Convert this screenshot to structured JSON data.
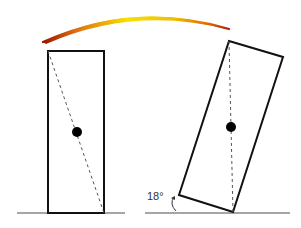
{
  "diagram": {
    "title": "",
    "transition_arrow": {
      "from": "upright-block",
      "to": "tilted-block",
      "colors": {
        "ends": "#a01a00",
        "mid": "#f5d800"
      }
    },
    "upright_block": {
      "description": "Rectangle standing upright on ground with dashed diagonal and center-of-mass dot"
    },
    "tilted_block": {
      "description": "Rectangle tilted on its corner with vertical dashed line through center-of-mass dot",
      "angle_label": "18°"
    },
    "colors": {
      "outline": "#111111",
      "ground": "#888888",
      "dash": "#555555",
      "dot": "#000000"
    }
  }
}
